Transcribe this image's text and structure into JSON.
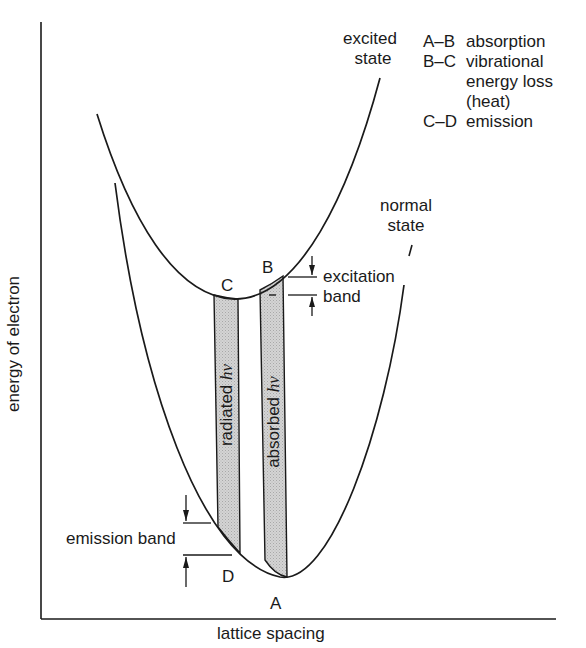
{
  "figure": {
    "y_axis_label": "energy of electron",
    "x_axis_label": "lattice spacing",
    "curves": {
      "excited": "excited state",
      "excited_line1": "excited",
      "excited_line2": "state",
      "normal_line1": "normal",
      "normal_line2": "state"
    },
    "points": {
      "A": "A",
      "B": "B",
      "C": "C",
      "D": "D"
    },
    "bars": {
      "radiated": "radiated",
      "absorbed": "absorbed",
      "symbol": "hν",
      "radiated_full": "radiated hν",
      "absorbed_full": "absorbed hν"
    },
    "bands": {
      "excitation_line1": "excitation",
      "excitation_line2": "band",
      "emission": "emission band"
    },
    "legend": [
      {
        "key": "A–B",
        "value": "absorption"
      },
      {
        "key": "B–C",
        "value": "vibrational"
      },
      {
        "key": "",
        "value": "energy loss"
      },
      {
        "key": "",
        "value": "(heat)"
      },
      {
        "key": "C–D",
        "value": "emission"
      }
    ],
    "colors": {
      "line": "#1a1a1a",
      "bar_fill": "#cfcfcf",
      "background": "#ffffff"
    }
  }
}
